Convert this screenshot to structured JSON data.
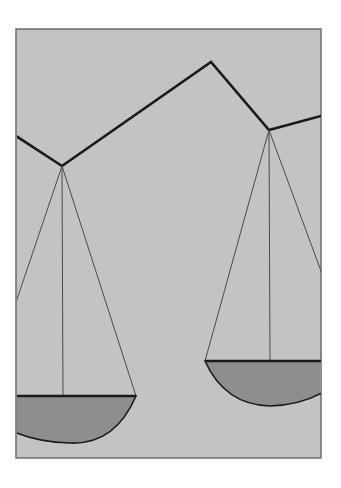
{
  "illustration": {
    "subject": "balance scales",
    "colors": {
      "page": "#ffffff",
      "panel": "#c3c3c3",
      "frame": "#6e6e6e",
      "beam": "#1a1a1a",
      "strings": "#4a4a4a",
      "pan_fill": "#8e8e8e",
      "pan_edge": "#1a1a1a"
    }
  }
}
